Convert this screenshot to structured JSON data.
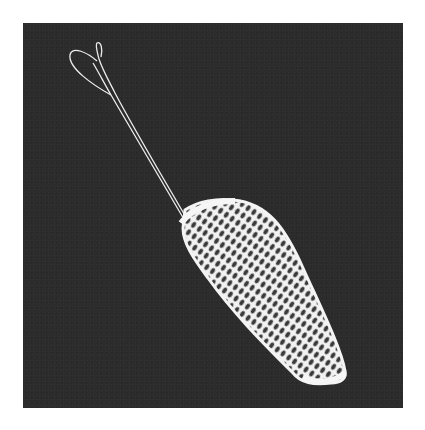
{
  "image": {
    "description": "Black-and-white photograph of a white crocheted/netted drawstring pouch with a long looped cord on a dark background",
    "subject": "crocheted net pouch with drawstring cord",
    "colors": {
      "page_background": "#ffffff",
      "photo_background": "#2c2c2c",
      "thread": "#f2f2f2"
    }
  }
}
